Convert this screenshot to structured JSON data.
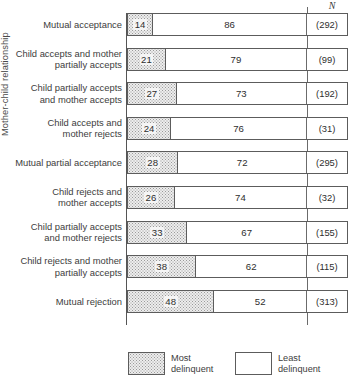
{
  "chart_data": {
    "type": "bar",
    "subtype": "100% stacked horizontal bar",
    "title": "",
    "xlabel": "",
    "ylabel": "Mother-child relationship",
    "xlim": [
      0,
      100
    ],
    "grid": false,
    "legend_position": "bottom",
    "categories": [
      "Mutual acceptance",
      "Child accepts and mother\npartially accepts",
      "Child partially accepts\nand mother accepts",
      "Child accepts and\nmother rejects",
      "Mutual partial acceptance",
      "Child rejects and\nmother accepts",
      "Child partially accepts\nand mother rejects",
      "Child rejects and mother\npartially accepts",
      "Mutual rejection"
    ],
    "series": [
      {
        "name": "Most delinquent",
        "values": [
          14,
          21,
          27,
          24,
          28,
          26,
          33,
          38,
          48
        ]
      },
      {
        "name": "Least delinquent",
        "values": [
          86,
          79,
          73,
          76,
          72,
          74,
          67,
          62,
          52
        ]
      }
    ],
    "n_header": "N",
    "n_values": [
      "(292)",
      "(99)",
      "(192)",
      "(31)",
      "(295)",
      "(32)",
      "(155)",
      "(115)",
      "(313)"
    ]
  },
  "axis": {
    "y_title": "Mother-child relationship",
    "n_column_header": "N"
  },
  "rows": [
    {
      "label": "Mutual acceptance",
      "lines": 1,
      "most": 14,
      "least": 86,
      "most_label": "14",
      "least_label": "86",
      "n": "(292)"
    },
    {
      "label": "Child accepts and mother\npartially accepts",
      "lines": 2,
      "most": 21,
      "least": 79,
      "most_label": "21",
      "least_label": "79",
      "n": "(99)"
    },
    {
      "label": "Child partially accepts\nand mother accepts",
      "lines": 2,
      "most": 27,
      "least": 73,
      "most_label": "27",
      "least_label": "73",
      "n": "(192)"
    },
    {
      "label": "Child accepts and\nmother rejects",
      "lines": 2,
      "most": 24,
      "least": 76,
      "most_label": "24",
      "least_label": "76",
      "n": "(31)"
    },
    {
      "label": "Mutual partial acceptance",
      "lines": 1,
      "most": 28,
      "least": 72,
      "most_label": "28",
      "least_label": "72",
      "n": "(295)"
    },
    {
      "label": "Child rejects and\nmother accepts",
      "lines": 2,
      "most": 26,
      "least": 74,
      "most_label": "26",
      "least_label": "74",
      "n": "(32)"
    },
    {
      "label": "Child partially accepts\nand mother rejects",
      "lines": 2,
      "most": 33,
      "least": 67,
      "most_label": "33",
      "least_label": "67",
      "n": "(155)"
    },
    {
      "label": "Child rejects and mother\npartially accepts",
      "lines": 2,
      "most": 38,
      "least": 62,
      "most_label": "38",
      "least_label": "62",
      "n": "(115)"
    },
    {
      "label": "Mutual rejection",
      "lines": 1,
      "most": 48,
      "least": 52,
      "most_label": "48",
      "least_label": "52",
      "n": "(313)"
    }
  ],
  "legend": {
    "most": "Most\ndelinquent",
    "least": "Least\ndelinquent"
  },
  "caption": "",
  "colors": {
    "most_delinquent_fill": "#ededed",
    "most_delinquent_dots": "#9a9a9a",
    "least_delinquent_fill": "#ffffff",
    "border": "#5c5c5c",
    "text": "#3d3d3d",
    "background": "#ffffff"
  }
}
